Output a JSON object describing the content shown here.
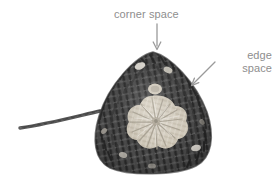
{
  "figure": {
    "type": "annotated-photograph",
    "background_color": "#ffffff",
    "width": 280,
    "height": 183
  },
  "annotations": {
    "text_color": "#8e8e8e",
    "arrow_color": "#9a9a9a",
    "corner_space": {
      "label": "corner space",
      "arrow": "down-arrow-icon",
      "arrow_direction": "down"
    },
    "edge_space": {
      "label_line_1": "edge",
      "label_line_2": "space",
      "arrow": "diagonal-arrow-icon",
      "arrow_direction": "down-left"
    }
  },
  "photo": {
    "alt": "Crochet triangle motif worked in dark grey yarn with a pale cream centre rosette and a loose yarn tail extending to the left",
    "yarn_border_color": "#4b4b4b",
    "yarn_border_dark": "#2e2e2e",
    "yarn_center_color": "#d9d2c4",
    "yarn_center_highlight": "#f2eee5",
    "yarn_tail_color": "#565656",
    "corner_space_hole_color": "#e8e4db"
  }
}
